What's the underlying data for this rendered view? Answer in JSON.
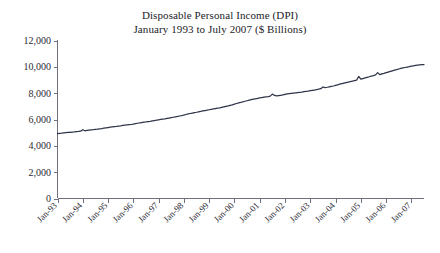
{
  "chart_data": {
    "type": "line",
    "title": "Disposable Personal Income (DPI)",
    "subtitle": "January 1993 to July 2007 ($ Billions)",
    "xlabel": "",
    "ylabel": "",
    "ylim": [
      0,
      12000
    ],
    "ytick_labels": [
      "12,000",
      "10,000",
      "8,000",
      "6,000",
      "4,000",
      "2,000",
      "0"
    ],
    "ytick_values": [
      12000,
      10000,
      8000,
      6000,
      4000,
      2000,
      0
    ],
    "xtick_labels": [
      "Jan-93",
      "Jan-94",
      "Jan-95",
      "Jan-96",
      "Jan-97",
      "Jan-98",
      "Jan-99",
      "Jan-00",
      "Jan-01",
      "Jan-02",
      "Jan-03",
      "Jan-04",
      "Jan-05",
      "Jan-06",
      "Jan-07"
    ],
    "grid": false,
    "legend": false,
    "line_color": "#2f3347",
    "x": [
      "1993-01",
      "1993-02",
      "1993-03",
      "1993-04",
      "1993-05",
      "1993-06",
      "1993-07",
      "1993-08",
      "1993-09",
      "1993-10",
      "1993-11",
      "1993-12",
      "1994-01",
      "1994-02",
      "1994-03",
      "1994-04",
      "1994-05",
      "1994-06",
      "1994-07",
      "1994-08",
      "1994-09",
      "1994-10",
      "1994-11",
      "1994-12",
      "1995-01",
      "1995-02",
      "1995-03",
      "1995-04",
      "1995-05",
      "1995-06",
      "1995-07",
      "1995-08",
      "1995-09",
      "1995-10",
      "1995-11",
      "1995-12",
      "1996-01",
      "1996-02",
      "1996-03",
      "1996-04",
      "1996-05",
      "1996-06",
      "1996-07",
      "1996-08",
      "1996-09",
      "1996-10",
      "1996-11",
      "1996-12",
      "1997-01",
      "1997-02",
      "1997-03",
      "1997-04",
      "1997-05",
      "1997-06",
      "1997-07",
      "1997-08",
      "1997-09",
      "1997-10",
      "1997-11",
      "1997-12",
      "1998-01",
      "1998-02",
      "1998-03",
      "1998-04",
      "1998-05",
      "1998-06",
      "1998-07",
      "1998-08",
      "1998-09",
      "1998-10",
      "1998-11",
      "1998-12",
      "1999-01",
      "1999-02",
      "1999-03",
      "1999-04",
      "1999-05",
      "1999-06",
      "1999-07",
      "1999-08",
      "1999-09",
      "1999-10",
      "1999-11",
      "1999-12",
      "2000-01",
      "2000-02",
      "2000-03",
      "2000-04",
      "2000-05",
      "2000-06",
      "2000-07",
      "2000-08",
      "2000-09",
      "2000-10",
      "2000-11",
      "2000-12",
      "2001-01",
      "2001-02",
      "2001-03",
      "2001-04",
      "2001-05",
      "2001-06",
      "2001-07",
      "2001-08",
      "2001-09",
      "2001-10",
      "2001-11",
      "2001-12",
      "2002-01",
      "2002-02",
      "2002-03",
      "2002-04",
      "2002-05",
      "2002-06",
      "2002-07",
      "2002-08",
      "2002-09",
      "2002-10",
      "2002-11",
      "2002-12",
      "2003-01",
      "2003-02",
      "2003-03",
      "2003-04",
      "2003-05",
      "2003-06",
      "2003-07",
      "2003-08",
      "2003-09",
      "2003-10",
      "2003-11",
      "2003-12",
      "2004-01",
      "2004-02",
      "2004-03",
      "2004-04",
      "2004-05",
      "2004-06",
      "2004-07",
      "2004-08",
      "2004-09",
      "2004-10",
      "2004-11",
      "2004-12",
      "2005-01",
      "2005-02",
      "2005-03",
      "2005-04",
      "2005-05",
      "2005-06",
      "2005-07",
      "2005-08",
      "2005-09",
      "2005-10",
      "2005-11",
      "2005-12",
      "2006-01",
      "2006-02",
      "2006-03",
      "2006-04",
      "2006-05",
      "2006-06",
      "2006-07",
      "2006-08",
      "2006-09",
      "2006-10",
      "2006-11",
      "2006-12",
      "2007-01",
      "2007-02",
      "2007-03",
      "2007-04",
      "2007-05",
      "2007-06",
      "2007-07"
    ],
    "values": [
      4930,
      4945,
      4960,
      4985,
      5000,
      5015,
      5030,
      5045,
      5055,
      5075,
      5090,
      5110,
      5225,
      5145,
      5165,
      5185,
      5205,
      5225,
      5250,
      5270,
      5295,
      5315,
      5340,
      5365,
      5390,
      5415,
      5435,
      5455,
      5475,
      5500,
      5520,
      5545,
      5565,
      5585,
      5605,
      5620,
      5650,
      5685,
      5715,
      5740,
      5770,
      5795,
      5815,
      5840,
      5865,
      5895,
      5920,
      5945,
      5975,
      6005,
      6030,
      6050,
      6080,
      6110,
      6140,
      6170,
      6200,
      6230,
      6265,
      6295,
      6340,
      6380,
      6420,
      6455,
      6490,
      6520,
      6550,
      6585,
      6615,
      6650,
      6680,
      6705,
      6740,
      6770,
      6800,
      6830,
      6860,
      6890,
      6925,
      6960,
      6995,
      7030,
      7070,
      7110,
      7165,
      7215,
      7265,
      7300,
      7340,
      7385,
      7425,
      7465,
      7505,
      7540,
      7570,
      7600,
      7640,
      7670,
      7695,
      7720,
      7745,
      7775,
      7930,
      7830,
      7790,
      7815,
      7840,
      7865,
      7905,
      7940,
      7965,
      7985,
      8005,
      8025,
      8045,
      8065,
      8085,
      8110,
      8130,
      8150,
      8185,
      8215,
      8240,
      8265,
      8300,
      8340,
      8470,
      8420,
      8450,
      8485,
      8515,
      8545,
      8590,
      8635,
      8680,
      8720,
      8760,
      8800,
      8840,
      8880,
      8915,
      8955,
      8995,
      9270,
      9060,
      9110,
      9155,
      9200,
      9245,
      9290,
      9335,
      9385,
      9560,
      9410,
      9460,
      9505,
      9555,
      9605,
      9655,
      9700,
      9745,
      9790,
      9835,
      9880,
      9915,
      9950,
      9985,
      10015,
      10050,
      10080,
      10105,
      10125,
      10145,
      10160,
      10175
    ]
  }
}
